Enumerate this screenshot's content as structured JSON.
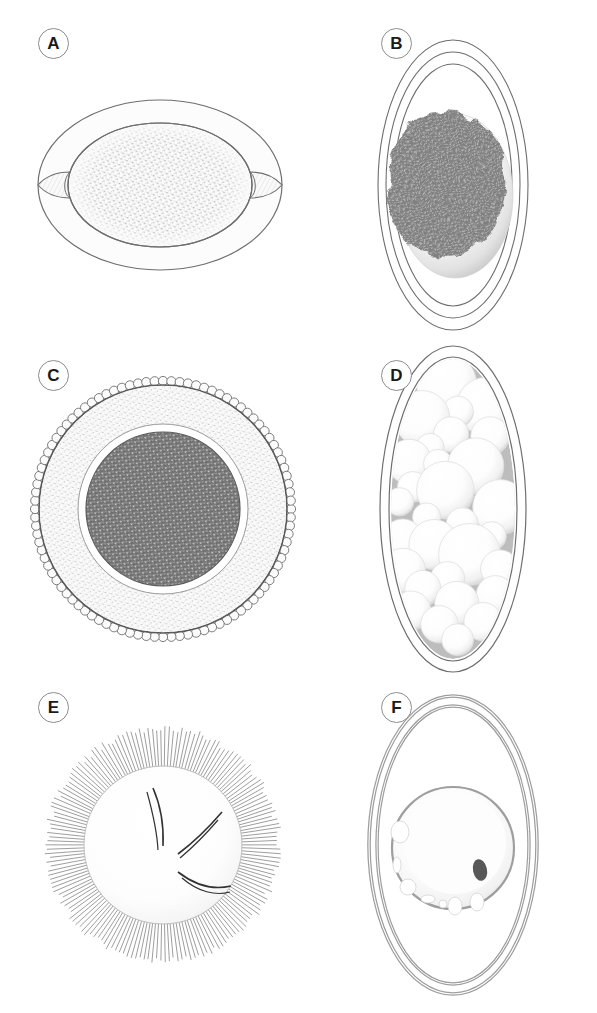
{
  "figure": {
    "background_color": "#ffffff",
    "width": 597,
    "height": 1013,
    "layout": "2-column x 3-row panel grid",
    "panel_count": 6
  },
  "style": {
    "outline_color": "#6e6e6e",
    "outline_color_dark": "#555555",
    "label_circle_color": "#8d8d8d",
    "label_text_color": "#1a1a1a",
    "stipple_light_color": "#b9b9b9",
    "stipple_dark_color": "#7a7a7a",
    "granule_color": "#808080",
    "shell_fill": "#fafafa",
    "cortex_fill": "#f4f4f4",
    "nucleus_color": "#585858",
    "sphere_fill": "#ffffff",
    "sphere_shadow": "#c9c9c9"
  },
  "panels": [
    {
      "id": "A",
      "label": "A",
      "label_x": 38,
      "label_y": 28,
      "description": "Horizontal barrel-shaped egg with smooth outer shell and bipolar plugs",
      "shape": "horizontal-ellipse",
      "features": [
        "outer-shell",
        "polar-plug-left",
        "polar-plug-right",
        "stippled-inner-mass"
      ],
      "texture": "fine light stipple",
      "center_x": 160,
      "center_y": 185,
      "outer_rx": 122,
      "outer_ry": 85,
      "inner_rx": 92,
      "inner_ry": 62
    },
    {
      "id": "B",
      "label": "B",
      "label_x": 381,
      "label_y": 28,
      "description": "Vertical oval with three concentric membrane layers enclosing a shaded sphere with a dense irregular granular mass",
      "shape": "vertical-ellipse",
      "features": [
        "membrane-ring-1",
        "membrane-ring-2",
        "membrane-ring-3",
        "shaded-sphere",
        "granular-blob"
      ],
      "texture": "dense vermiculate granules",
      "center_x": 453,
      "center_y": 185,
      "outer_rx": 75,
      "outer_ry": 145,
      "ring_count": 3
    },
    {
      "id": "C",
      "label": "C",
      "label_x": 38,
      "label_y": 360,
      "description": "Circular egg with beaded scalloped outer rim, pale stippled cortex and dark granular central core",
      "shape": "circle",
      "features": [
        "beaded-rim",
        "stippled-cortex",
        "clear-gap-ring",
        "dark-granular-core"
      ],
      "texture": "coarse dark granules in core, fine pale stipple in cortex",
      "center_x": 163,
      "center_y": 509,
      "outer_r": 131,
      "cortex_r": 124,
      "core_r": 77,
      "bead_count": 96
    },
    {
      "id": "D",
      "label": "D",
      "label_x": 381,
      "label_y": 360,
      "description": "Narrow vertical oval shell packed with numerous overlapping pale spherical blastomeres",
      "shape": "vertical-ellipse",
      "features": [
        "double-wall-shell",
        "blastomere-cluster"
      ],
      "texture": "overlapping white spheres with soft shading",
      "center_x": 453,
      "center_y": 509,
      "outer_rx": 73,
      "outer_ry": 163,
      "sphere_count": 30
    },
    {
      "id": "E",
      "label": "E",
      "label_x": 38,
      "label_y": 692,
      "description": "Spherical cell surrounded by a dense halo of fine radiating spines, with curved internal filament bundles",
      "shape": "circle",
      "features": [
        "radiating-spine-halo",
        "smooth-sphere",
        "curved-internal-filaments"
      ],
      "texture": "fine radial lines",
      "center_x": 163,
      "center_y": 845,
      "body_r": 79,
      "spine_outer_r": 116,
      "spine_count": 170,
      "filament_groups": 3
    },
    {
      "id": "F",
      "label": "F",
      "label_x": 381,
      "label_y": 692,
      "description": "Thick double-walled vertical oval containing a pale sphere with peripheral vacuoles and a single dark nucleus",
      "shape": "vertical-ellipse",
      "features": [
        "thick-double-wall",
        "inner-sphere",
        "peripheral-vacuoles",
        "dark-nucleus"
      ],
      "texture": "smooth with pale shading",
      "center_x": 453,
      "center_y": 845,
      "outer_rx": 84,
      "outer_ry": 149,
      "inner_r": 61,
      "vacuole_count": 7
    }
  ]
}
